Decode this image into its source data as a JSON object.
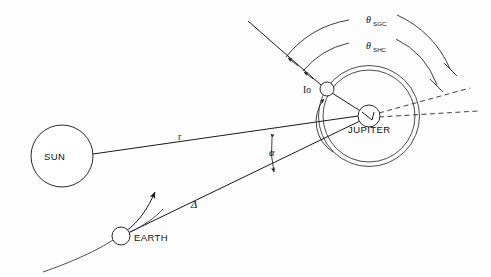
{
  "figure": {
    "type": "astronomical-geometry-diagram",
    "background_color": "#fdfdfd",
    "line_color": "#1a1a1a",
    "width": 491,
    "height": 277
  },
  "bodies": {
    "sun": {
      "label": "SUN",
      "cx": 62,
      "cy": 156,
      "r": 31
    },
    "earth": {
      "label": "EARTH",
      "cx": 121,
      "cy": 236,
      "r": 9
    },
    "jupiter": {
      "label": "JUPITER",
      "cx": 369,
      "cy": 116,
      "r": 11
    },
    "io": {
      "label": "Io",
      "cx": 327,
      "cy": 89,
      "r": 7
    }
  },
  "orbits": {
    "io_orbit_label": "io-orbit",
    "io_orbit_r": 46,
    "outer_orbit_r": 50,
    "earth_orbit_label": "earth-orbit-arc"
  },
  "distances": {
    "sun_jupiter": {
      "symbol": "r",
      "label_x": 178,
      "label_y": 140
    },
    "earth_jupiter": {
      "symbol": "Δ",
      "label_x": 193,
      "label_y": 207
    }
  },
  "angles": {
    "alpha": {
      "symbol": "α",
      "label_x": 273,
      "label_y": 153,
      "description": "phase angle at Jupiter between Sun and Earth"
    },
    "theta_sgc": {
      "symbol": "θ",
      "subscript": "SGC",
      "label_x": 366,
      "label_y": 22
    },
    "theta_shc": {
      "symbol": "θ",
      "subscript": "SHC",
      "label_x": 366,
      "label_y": 48
    }
  },
  "lines": {
    "sun_to_jupiter": "sun-jupiter-line",
    "earth_to_jupiter": "earth-jupiter-line",
    "sunlight_ray": "sunlight-ray-through-io",
    "jupiter_io_line": "jupiter-io-line",
    "reference_dashed_upper": "jupiter-reference-dashed-upper",
    "reference_dashed_lower": "jupiter-reference-dashed-lower",
    "earth_velocity_arrow": "earth-velocity-arrow"
  }
}
